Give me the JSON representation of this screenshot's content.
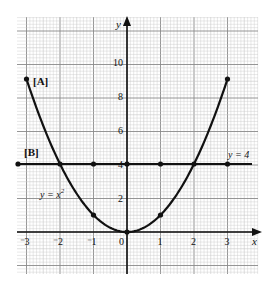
{
  "figure": {
    "labels": {
      "curve_a": "[A]",
      "line_b": "[B]",
      "curve_eq": "y = x",
      "curve_eq_exp": "2",
      "line_eq": "y = 4",
      "x_axis": "x",
      "y_axis": "y"
    },
    "x_ticks": [
      "3",
      "2",
      "1",
      "0",
      "1",
      "2",
      "3"
    ],
    "x_tick_prefix": [
      "⁻",
      "⁻",
      "⁻",
      "",
      "",
      "",
      ""
    ],
    "y_ticks": [
      "2",
      "4",
      "6",
      "8",
      "10"
    ],
    "colors": {
      "grid_minor": "#c8c8c8",
      "grid_major": "#8a8a8a",
      "ink": "#111111"
    }
  },
  "chart_data": {
    "type": "line",
    "title": "",
    "xlabel": "x",
    "ylabel": "y",
    "xlim": [
      -3.3,
      3.9
    ],
    "ylim": [
      -2.5,
      12.5
    ],
    "grid": true,
    "series": [
      {
        "name": "[A] y = x^2",
        "x": [
          -3,
          -2,
          -1,
          0,
          1,
          2,
          3
        ],
        "y": [
          9,
          4,
          1,
          0,
          1,
          4,
          9
        ],
        "marked_points": [
          [
            -3,
            9
          ],
          [
            -1,
            1
          ],
          [
            0,
            0
          ],
          [
            1,
            1
          ],
          [
            3,
            9
          ]
        ]
      },
      {
        "name": "[B] y = 4",
        "x": [
          -3,
          -2,
          -1,
          0,
          1,
          2,
          3
        ],
        "y": [
          4,
          4,
          4,
          4,
          4,
          4,
          4
        ],
        "marked_points": [
          [
            -3,
            4
          ],
          [
            -2,
            4
          ],
          [
            -1,
            4
          ],
          [
            0,
            4
          ],
          [
            1,
            4
          ],
          [
            2,
            4
          ],
          [
            3,
            4
          ]
        ]
      }
    ],
    "annotations": [
      "[A]",
      "[B]",
      "y = x^2",
      "y = 4"
    ]
  }
}
